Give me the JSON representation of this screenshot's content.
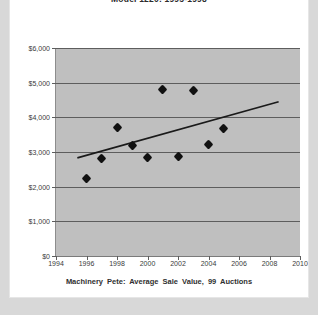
{
  "chart_title": "Model 1220: 1995-1998",
  "caption": "Machinery Pete:  Average  Sale  Value,  99  Auctions",
  "colors": {
    "page_background": "#d8d8d8",
    "card_background": "#ffffff",
    "plot_background": "#bfbfbf",
    "gridline": "#5d5d5d",
    "marker": "#111111",
    "trendline": "#1a1a1a",
    "tick_label": "#3a3a3a"
  },
  "chart_data": {
    "type": "scatter",
    "title": "Model 1220: 1995-1998",
    "xlabel": "",
    "ylabel": "",
    "xlim": [
      1994,
      2010
    ],
    "ylim": [
      0,
      6000
    ],
    "grid": true,
    "legend": "none",
    "xticks": [
      "1994",
      "1996",
      "1998",
      "2000",
      "2002",
      "2004",
      "2006",
      "2008",
      "2010"
    ],
    "xtick_values": [
      1994,
      1996,
      1998,
      2000,
      2002,
      2004,
      2006,
      2008,
      2010
    ],
    "yticks": [
      "$0",
      "$1,000",
      "$2,000",
      "$3,000",
      "$4,000",
      "$5,000",
      "$6,000"
    ],
    "ytick_values": [
      0,
      1000,
      2000,
      3000,
      4000,
      5000,
      6000
    ],
    "series": [
      {
        "name": "Average Sale Value",
        "marker": "diamond",
        "x": [
          1996,
          1997,
          1998,
          1999,
          2000,
          2001,
          2002,
          2003,
          2004,
          2005
        ],
        "y": [
          2250,
          2800,
          3700,
          3180,
          2830,
          4800,
          2860,
          4780,
          3220,
          3670
        ]
      }
    ],
    "trendline": {
      "name": "Linear trend",
      "x": [
        1995.4,
        2008.6
      ],
      "y": [
        2830,
        4450
      ]
    }
  }
}
